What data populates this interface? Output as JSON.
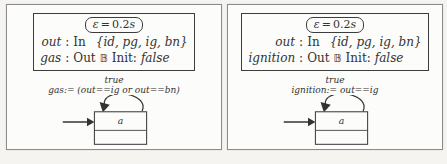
{
  "colors": {
    "ink": "#333333",
    "panel_border": "#8c8c8c",
    "background": "#f5f4f1",
    "panel_bg": "#fcfcfa"
  },
  "panels": [
    {
      "header": {
        "epsilon": {
          "symbol": "ε",
          "eq": "=",
          "value": "0.2",
          "unit": "s"
        },
        "row1": {
          "var": "out",
          "colon": ":",
          "dir": "In",
          "set": "{id, pg, ig, bn}"
        },
        "row2": {
          "var": "gas",
          "colon": ":",
          "dir": "Out",
          "type": "𝔹",
          "init_label": "Init:",
          "init_value": "false"
        }
      },
      "transition": {
        "guard": "true",
        "action": "gas:= (out==ig or out==bn)"
      },
      "machine": {
        "state_label": "a"
      }
    },
    {
      "header": {
        "epsilon": {
          "symbol": "ε",
          "eq": "=",
          "value": "0.2",
          "unit": "s"
        },
        "row1": {
          "var": "out",
          "colon": ":",
          "dir": "In",
          "set": "{id, pg, ig, bn}"
        },
        "row2": {
          "var": "ignition",
          "colon": ":",
          "dir": "Out",
          "type": "𝔹",
          "init_label": "Init:",
          "init_value": "false"
        }
      },
      "transition": {
        "guard": "true",
        "action": "ignition:= out==ig"
      },
      "machine": {
        "state_label": "a"
      }
    }
  ]
}
